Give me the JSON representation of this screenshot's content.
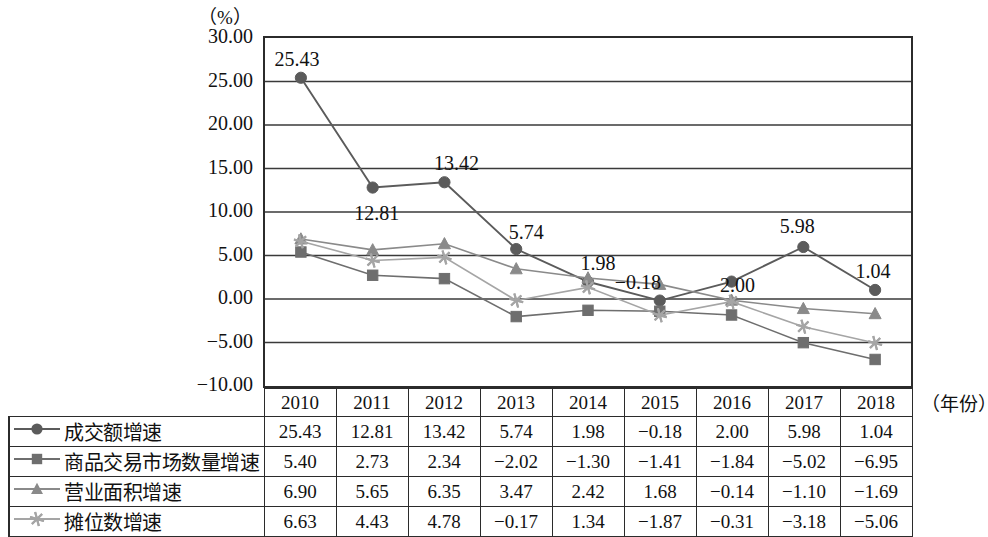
{
  "chart_data": {
    "type": "line",
    "title": "",
    "ylabel": "（%）",
    "xlabel": "（年份）",
    "categories": [
      "2010",
      "2011",
      "2012",
      "2013",
      "2014",
      "2015",
      "2016",
      "2017",
      "2018"
    ],
    "ylim": [
      -10.0,
      30.0
    ],
    "yticks": [
      "30.00",
      "25.00",
      "20.00",
      "15.00",
      "10.00",
      "5.00",
      "0.00",
      "−5.00",
      "−10.00"
    ],
    "ytick_values": [
      30,
      25,
      20,
      15,
      10,
      5,
      0,
      -5,
      -10
    ],
    "grid": true,
    "legend_position": "table-left-column",
    "series": [
      {
        "name": "成交额增速",
        "marker": "circle",
        "color": "#5b5b5b",
        "values": [
          25.43,
          12.81,
          13.42,
          5.74,
          1.98,
          -0.18,
          2.0,
          5.98,
          1.04
        ],
        "labels": [
          "25.43",
          "12.81",
          "13.42",
          "5.74",
          "1.98",
          "−0.18",
          "2.00",
          "5.98",
          "1.04"
        ]
      },
      {
        "name": "商品交易市场数量增速",
        "marker": "square",
        "color": "#6e6e6e",
        "values": [
          5.4,
          2.73,
          2.34,
          -2.02,
          -1.3,
          -1.41,
          -1.84,
          -5.02,
          -6.95
        ],
        "labels": [
          "5.40",
          "2.73",
          "2.34",
          "−2.02",
          "−1.30",
          "−1.41",
          "−1.84",
          "−5.02",
          "−6.95"
        ]
      },
      {
        "name": "营业面积增速",
        "marker": "triangle",
        "color": "#8a8a8a",
        "values": [
          6.9,
          5.65,
          6.35,
          3.47,
          2.42,
          1.68,
          -0.14,
          -1.1,
          -1.69
        ],
        "labels": [
          "6.90",
          "5.65",
          "6.35",
          "3.47",
          "2.42",
          "1.68",
          "−0.14",
          "−1.10",
          "−1.69"
        ]
      },
      {
        "name": "摊位数增速",
        "marker": "asterisk",
        "color": "#a5a5a5",
        "values": [
          6.63,
          4.43,
          4.78,
          -0.17,
          1.34,
          -1.87,
          -0.31,
          -3.18,
          -5.06
        ],
        "labels": [
          "6.63",
          "4.43",
          "4.78",
          "−0.17",
          "1.34",
          "−1.87",
          "−0.31",
          "−3.18",
          "−5.06"
        ]
      }
    ],
    "annotations": [
      {
        "text": "25.43",
        "x": 0,
        "value": 25.43
      },
      {
        "text": "12.81",
        "x": 1,
        "value": 12.81
      },
      {
        "text": "13.42",
        "x": 2,
        "value": 13.42
      },
      {
        "text": "5.74",
        "x": 3,
        "value": 5.74
      },
      {
        "text": "1.98",
        "x": 4,
        "value": 1.98
      },
      {
        "text": "−0.18",
        "x": 5,
        "value": -0.18
      },
      {
        "text": "2.00",
        "x": 6,
        "value": 2.0
      },
      {
        "text": "5.98",
        "x": 7,
        "value": 5.98
      },
      {
        "text": "1.04",
        "x": 8,
        "value": 1.04
      }
    ]
  },
  "table": {
    "header": [
      "2010",
      "2011",
      "2012",
      "2013",
      "2014",
      "2015",
      "2016",
      "2017",
      "2018"
    ],
    "rows": [
      {
        "label": "成交额增速",
        "marker": "circle-marker-icon",
        "values": [
          "25.43",
          "12.81",
          "13.42",
          "5.74",
          "1.98",
          "−0.18",
          "2.00",
          "5.98",
          "1.04"
        ]
      },
      {
        "label": "商品交易市场数量增速",
        "marker": "square-marker-icon",
        "values": [
          "5.40",
          "2.73",
          "2.34",
          "−2.02",
          "−1.30",
          "−1.41",
          "−1.84",
          "−5.02",
          "−6.95"
        ]
      },
      {
        "label": "营业面积增速",
        "marker": "triangle-marker-icon",
        "values": [
          "6.90",
          "5.65",
          "6.35",
          "3.47",
          "2.42",
          "1.68",
          "−0.14",
          "−1.10",
          "−1.69"
        ]
      },
      {
        "label": "摊位数增速",
        "marker": "asterisk-marker-icon",
        "values": [
          "6.63",
          "4.43",
          "4.78",
          "−0.17",
          "1.34",
          "−1.87",
          "−0.31",
          "−3.18",
          "−5.06"
        ]
      }
    ]
  },
  "axis": {
    "unit_y": "（%）",
    "unit_x": "（年份）"
  }
}
